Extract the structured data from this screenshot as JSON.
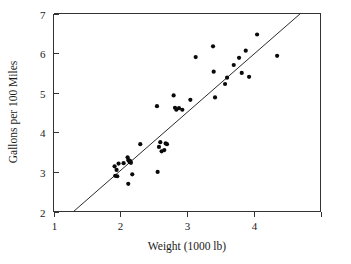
{
  "chart_data": {
    "type": "scatter",
    "title": "",
    "xlabel": "Weight (1000 lb)",
    "ylabel": "Gallons per 100 Miles",
    "xlim": [
      1,
      5
    ],
    "ylim": [
      2,
      7
    ],
    "xticks": [
      1,
      2,
      3,
      4,
      5
    ],
    "xticklabels": [
      "1",
      "2",
      "3",
      "4",
      ""
    ],
    "yticks": [
      2,
      3,
      4,
      5,
      6,
      7
    ],
    "yticklabels": [
      "2",
      "3",
      "4",
      "5",
      "6",
      "7"
    ],
    "grid": false,
    "legend": null,
    "marker": "filled-circle",
    "points": [
      {
        "x": 1.915,
        "y": 3.14
      },
      {
        "x": 1.925,
        "y": 2.9
      },
      {
        "x": 1.945,
        "y": 3.05
      },
      {
        "x": 1.955,
        "y": 2.89
      },
      {
        "x": 1.975,
        "y": 3.21
      },
      {
        "x": 2.05,
        "y": 3.22
      },
      {
        "x": 2.11,
        "y": 3.37
      },
      {
        "x": 2.12,
        "y": 3.3
      },
      {
        "x": 2.13,
        "y": 3.29
      },
      {
        "x": 2.14,
        "y": 3.25
      },
      {
        "x": 2.15,
        "y": 3.27
      },
      {
        "x": 2.16,
        "y": 3.23
      },
      {
        "x": 2.12,
        "y": 2.7
      },
      {
        "x": 2.18,
        "y": 2.94
      },
      {
        "x": 2.3,
        "y": 3.7
      },
      {
        "x": 2.55,
        "y": 4.66
      },
      {
        "x": 2.56,
        "y": 3.0
      },
      {
        "x": 2.58,
        "y": 3.63
      },
      {
        "x": 2.6,
        "y": 3.75
      },
      {
        "x": 2.62,
        "y": 3.52
      },
      {
        "x": 2.66,
        "y": 3.55
      },
      {
        "x": 2.68,
        "y": 3.72
      },
      {
        "x": 2.7,
        "y": 3.7
      },
      {
        "x": 2.8,
        "y": 4.93
      },
      {
        "x": 2.82,
        "y": 4.62
      },
      {
        "x": 2.84,
        "y": 4.57
      },
      {
        "x": 2.88,
        "y": 4.61
      },
      {
        "x": 2.93,
        "y": 4.57
      },
      {
        "x": 3.05,
        "y": 4.82
      },
      {
        "x": 3.13,
        "y": 5.9
      },
      {
        "x": 3.39,
        "y": 6.17
      },
      {
        "x": 3.4,
        "y": 5.53
      },
      {
        "x": 3.42,
        "y": 4.88
      },
      {
        "x": 3.57,
        "y": 5.22
      },
      {
        "x": 3.6,
        "y": 5.38
      },
      {
        "x": 3.7,
        "y": 5.7
      },
      {
        "x": 3.78,
        "y": 5.88
      },
      {
        "x": 3.82,
        "y": 5.5
      },
      {
        "x": 3.88,
        "y": 6.06
      },
      {
        "x": 3.93,
        "y": 5.4
      },
      {
        "x": 4.05,
        "y": 6.47
      },
      {
        "x": 4.35,
        "y": 5.93
      }
    ],
    "fit_line": {
      "label": "least-squares line",
      "x_start": 1.3,
      "y_start": 2.0,
      "x_end": 4.7,
      "y_end": 7.0
    }
  },
  "colors": {
    "point": "#0a0a0a",
    "line": "#2b2b2b",
    "axis": "#333333",
    "background": "#ffffff",
    "text": "#1a1a1a"
  }
}
